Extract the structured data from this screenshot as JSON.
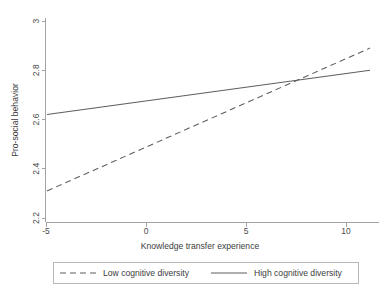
{
  "chart_data": {
    "type": "line",
    "title": "",
    "xlabel": "Knowledge transfer experience",
    "ylabel": "Pro-social behavior",
    "xlim": [
      -4.95,
      11.2
    ],
    "ylim": [
      2.2,
      3.0
    ],
    "xticks": [
      -5,
      0,
      5,
      10
    ],
    "xticklabels": [
      "-5",
      "0",
      "5",
      "10"
    ],
    "yticks": [
      2.2,
      2.4,
      2.6,
      2.8,
      3.0
    ],
    "yticklabels": [
      "2.2",
      "2.4",
      "2.6",
      "2.8",
      "3"
    ],
    "grid": false,
    "legend_position": "below-plot",
    "series": [
      {
        "name": "Low cognitive diversity",
        "style": "dashed",
        "color": "#5e5e5e",
        "x": [
          -4.95,
          11.2
        ],
        "values": [
          2.31,
          2.89
        ]
      },
      {
        "name": "High cognitive diversity",
        "style": "solid",
        "color": "#5e5e5e",
        "x": [
          -4.95,
          11.2
        ],
        "values": [
          2.62,
          2.8
        ]
      }
    ],
    "crossover": {
      "x": 7.4,
      "y": 2.76
    }
  },
  "legend": {
    "entries": [
      {
        "label": "Low cognitive diversity",
        "style": "dashed"
      },
      {
        "label": "High cognitive diversity",
        "style": "solid"
      }
    ]
  }
}
